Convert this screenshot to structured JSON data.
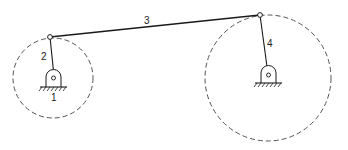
{
  "diagram": {
    "type": "four-bar-linkage",
    "labels": {
      "ground": "1",
      "crank": "2",
      "coupler": "3",
      "rocker": "4"
    },
    "colors": {
      "stroke": "#1a1a1a",
      "dashed": "#555555",
      "background": "#ffffff"
    }
  }
}
